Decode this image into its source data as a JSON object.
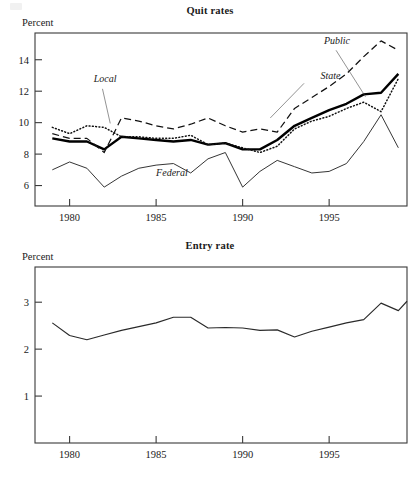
{
  "chart_data": [
    {
      "type": "line",
      "title": "Quit rates",
      "ylabel": "Percent",
      "xlabel": "",
      "grid": false,
      "legend": "inline-annotations",
      "xlim": [
        1978,
        1999.5
      ],
      "ylim": [
        4.7,
        15.7
      ],
      "xticks": [
        1980,
        1985,
        1990,
        1995
      ],
      "xtick_labels": [
        "1980",
        "1985",
        "1990",
        "1995"
      ],
      "yticks": [
        6,
        8,
        10,
        12,
        14
      ],
      "ytick_labels": [
        "6",
        "8",
        "10",
        "12",
        "14"
      ],
      "x": [
        1979,
        1980,
        1981,
        1982,
        1983,
        1984,
        1985,
        1986,
        1987,
        1988,
        1989,
        1990,
        1991,
        1992,
        1993,
        1994,
        1995,
        1996,
        1997,
        1998,
        1999
      ],
      "series": [
        {
          "name": "Public",
          "style": "bold-solid",
          "values": [
            9.0,
            8.8,
            8.8,
            8.3,
            9.1,
            9.0,
            8.9,
            8.8,
            8.9,
            8.6,
            8.7,
            8.3,
            8.3,
            8.9,
            9.8,
            10.3,
            10.8,
            11.2,
            11.8,
            11.9,
            13.1
          ]
        },
        {
          "name": "State",
          "style": "dashed",
          "values": [
            9.3,
            9.0,
            9.0,
            8.1,
            10.3,
            10.1,
            9.8,
            9.6,
            9.9,
            10.3,
            9.8,
            9.4,
            9.6,
            9.4,
            10.9,
            11.6,
            12.3,
            13.1,
            14.2,
            15.2,
            14.6
          ]
        },
        {
          "name": "Local",
          "style": "dotted",
          "values": [
            9.7,
            9.3,
            9.8,
            9.7,
            9.1,
            9.1,
            9.0,
            9.0,
            9.2,
            8.6,
            8.7,
            8.4,
            8.1,
            8.5,
            9.6,
            10.1,
            10.4,
            10.9,
            11.3,
            10.7,
            12.8
          ]
        },
        {
          "name": "Federal",
          "style": "thin-solid",
          "values": [
            7.0,
            7.5,
            7.1,
            5.9,
            6.6,
            7.1,
            7.3,
            7.4,
            6.8,
            7.7,
            8.1,
            5.9,
            6.9,
            7.6,
            7.2,
            6.8,
            6.9,
            7.4,
            8.8,
            10.5,
            8.4
          ]
        }
      ],
      "annotations": [
        {
          "text": "Local",
          "x": 1981.4,
          "y": 12.6
        },
        {
          "text": "Federal",
          "x": 1985.0,
          "y": 6.6
        },
        {
          "text": "Public",
          "x": 1994.7,
          "y": 15.0
        },
        {
          "text": "State",
          "x": 1994.5,
          "y": 12.8
        }
      ]
    },
    {
      "type": "line",
      "title": "Entry rate",
      "ylabel": "Percent",
      "xlabel": "",
      "grid": false,
      "legend": "none",
      "xlim": [
        1978,
        1999.5
      ],
      "ylim": [
        0.0,
        3.75
      ],
      "xticks": [
        1980,
        1985,
        1990,
        1995
      ],
      "xtick_labels": [
        "1980",
        "1985",
        "1990",
        "1995"
      ],
      "yticks": [
        1,
        2,
        3
      ],
      "ytick_labels": [
        "1",
        "2",
        "3"
      ],
      "x": [
        1979,
        1980,
        1981,
        1982,
        1983,
        1984,
        1985,
        1986,
        1987,
        1988,
        1989,
        1990,
        1991,
        1992,
        1993,
        1994,
        1995,
        1996,
        1997,
        1998,
        1999
      ],
      "series": [
        {
          "name": "Entry rate",
          "style": "thin-solid",
          "values": [
            2.56,
            2.29,
            2.2,
            2.3,
            2.4,
            2.48,
            2.56,
            2.68,
            2.68,
            2.45,
            2.46,
            2.45,
            2.4,
            2.41,
            2.26,
            2.38,
            2.47,
            2.56,
            2.63,
            2.98,
            2.82,
            3.02
          ]
        }
      ],
      "annotations": []
    }
  ]
}
